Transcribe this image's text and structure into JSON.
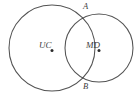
{
  "figure": {
    "kind": "geometry-diagram",
    "background_color": "#ffffff",
    "stroke_color": "#3a3a3a",
    "dot_color": "#2b2b2b",
    "canvas": {
      "width": 139,
      "height": 99
    },
    "circles": [
      {
        "name": "left-circle",
        "center_label": "UC",
        "cx": 52,
        "cy": 48,
        "r": 43
      },
      {
        "name": "right-circle",
        "center_label": "MD",
        "cx": 99,
        "cy": 48,
        "r": 34
      }
    ],
    "center_dots": [
      {
        "name": "left-center-dot",
        "cx": 52,
        "cy": 50.5,
        "r": 1.5
      },
      {
        "name": "right-center-dot",
        "cx": 99,
        "cy": 50.5,
        "r": 1.5
      }
    ],
    "labels": {
      "left_center": "UC",
      "right_center": "MD",
      "top_intersection": "A",
      "bottom_intersection": "B"
    },
    "intersection_points": [
      {
        "name": "A",
        "x": 82,
        "y": 15
      },
      {
        "name": "B",
        "x": 82,
        "y": 82
      }
    ]
  }
}
